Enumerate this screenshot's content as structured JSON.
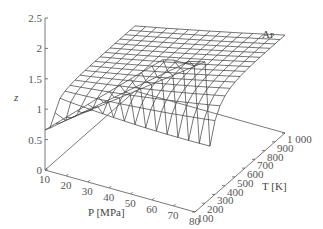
{
  "chart_data": {
    "type": "surface",
    "title": "",
    "annotation": "Ar",
    "zlabel": "z",
    "xlabel": "P [MPa]",
    "ylabel": "T [K]",
    "z_ticks": [
      "0",
      "0.5",
      "1",
      "1.5",
      "2",
      "2.5"
    ],
    "z_tick_values": [
      0,
      0.5,
      1,
      1.5,
      2,
      2.5
    ],
    "p_ticks": [
      "10",
      "20",
      "30",
      "40",
      "50",
      "60",
      "70",
      "80"
    ],
    "p_tick_values": [
      10,
      20,
      30,
      40,
      50,
      60,
      70,
      80
    ],
    "t_ticks": [
      "100",
      "200",
      "300",
      "400",
      "500",
      "600",
      "700",
      "800",
      "900",
      "1 000"
    ],
    "t_tick_values": [
      100,
      200,
      300,
      400,
      500,
      600,
      700,
      800,
      900,
      1000
    ],
    "zlim": [
      0,
      2.5
    ],
    "plim": [
      10,
      80
    ],
    "tlim": [
      100,
      1000
    ],
    "grid": false,
    "surface": {
      "p_values": [
        10,
        15,
        20,
        25,
        30,
        35,
        40,
        45,
        50,
        55,
        60,
        65,
        70,
        75,
        80
      ],
      "t_values": [
        100,
        150,
        200,
        250,
        300,
        350,
        400,
        450,
        500,
        550,
        600,
        650,
        700,
        750,
        800,
        850,
        900,
        950,
        1000
      ],
      "description": "Compressibility factor z of argon vs pressure P and temperature T; z < 1 at low T / moderate P, rising above 2 at low T / high P, approaching ~1.2-1.5 at high T"
    }
  },
  "labels": {
    "annotation": "Ar",
    "z_axis": "z",
    "p_axis": "P [MPa]",
    "t_axis": "T [K]"
  }
}
